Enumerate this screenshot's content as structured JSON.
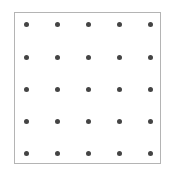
{
  "grid": {
    "rows": 5,
    "cols": 5,
    "dot_color": "#444444",
    "border_color": "#b4b4b4",
    "col_positions": [
      26,
      57,
      88,
      119,
      150
    ],
    "row_positions": [
      24,
      57,
      89,
      121,
      153
    ]
  }
}
